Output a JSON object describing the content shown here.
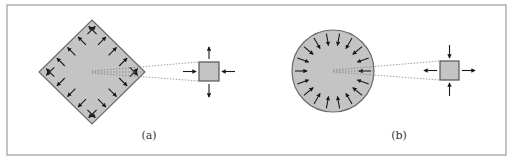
{
  "figure": {
    "panels": [
      {
        "id": "a",
        "label": "(a)",
        "shape": "diamond",
        "stress_direction": "outward",
        "inset_square": {
          "horizontal_arrows": "inward",
          "vertical_arrows": "outward"
        }
      },
      {
        "id": "b",
        "label": "(b)",
        "shape": "circle",
        "stress_direction": "inward",
        "inset_square": {
          "horizontal_arrows": "outward",
          "vertical_arrows": "inward"
        }
      }
    ],
    "colors": {
      "fill": "#c4c4c4",
      "stroke": "#6a6a6a",
      "arrow": "#1a1a1a",
      "frame": "#8a8a8a",
      "dotted": "#777777"
    }
  }
}
